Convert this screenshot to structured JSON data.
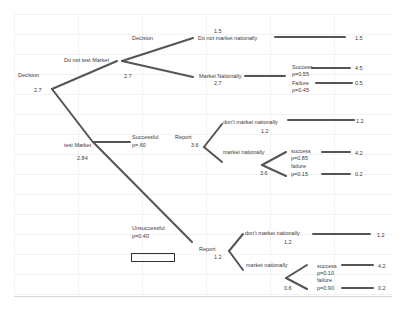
{
  "diagram": {
    "type": "decision-tree",
    "root": {
      "label": "Decision",
      "value": "2.7"
    },
    "do_not_test": {
      "branch_label": "Do not test Market",
      "node_label": "Decision",
      "node_value": "2.7",
      "do_not_market": {
        "label": "Do not market nationally",
        "value": "1.5",
        "payoff": "1.5"
      },
      "market": {
        "label": "Market Nationally",
        "value": "2.7",
        "success": {
          "label": "Success",
          "prob": "p=0.55",
          "payoff": "4.5"
        },
        "failure": {
          "label": "Failure",
          "prob": "p=0.45",
          "payoff": "0.5"
        }
      }
    },
    "test": {
      "branch_label": "test Market",
      "node_value": "2.84",
      "successful": {
        "label": "Successful",
        "prob": "p=.60",
        "report_label": "Report",
        "report_value": "3.6",
        "dont_market": {
          "label": "don't market nationally",
          "value": "1.2",
          "payoff": "1.2"
        },
        "market": {
          "label": "market nationally",
          "value": "3.6",
          "success": {
            "label": "success",
            "prob": "p=0.85",
            "payoff": "4.2"
          },
          "failure": {
            "label": "failure",
            "prob": "p=0.15",
            "payoff": "0.2"
          }
        }
      },
      "unsuccessful": {
        "label": "Unsuccessful",
        "prob": "p=0.40",
        "report_label": "Report",
        "report_value": "1.2",
        "dont_market": {
          "label": "don't market nationally",
          "value": "1.2",
          "payoff": "1.2"
        },
        "market": {
          "label": "market nationally",
          "value": "0.6",
          "success": {
            "label": "success",
            "prob": "p=0.10",
            "payoff": "4.2"
          },
          "failure": {
            "label": "failure",
            "prob": "p=0.90",
            "payoff": "0.2"
          }
        }
      }
    }
  },
  "colors": {
    "line": "#555555",
    "text": "#3a3a3a",
    "grid": "#f1f1f1"
  }
}
